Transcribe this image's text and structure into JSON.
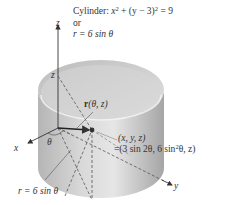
{
  "figure": {
    "type": "3D cylinder diagram (cylindrical coordinates parametrization)",
    "colors": {
      "surface_light": "#e8e8e8",
      "surface_dark": "#a9a9a9",
      "axis": "#333333",
      "dashed": "#555555",
      "vector": "#222222",
      "point": "#333333"
    },
    "labels": {
      "cylinder_title": "Cylinder: ",
      "cylinder_eq_x": "x",
      "cylinder_eq_mid": " + (y − 3)",
      "cylinder_eq_end": " = 9",
      "squared": "2",
      "or": "or",
      "polar_eq": "r = 6 sin θ",
      "z_axis": "z",
      "z_height": "z",
      "x_axis": "x",
      "y_axis": "y",
      "theta": "θ",
      "vector_bold": "r",
      "vector_args": "(θ, z)",
      "point_coords": "(x, y, z)",
      "point_param_a": "=(3 sin 2θ, 6 sin",
      "point_param_b": "θ, z)",
      "bottom_eq": "r = 6 sin θ"
    }
  }
}
